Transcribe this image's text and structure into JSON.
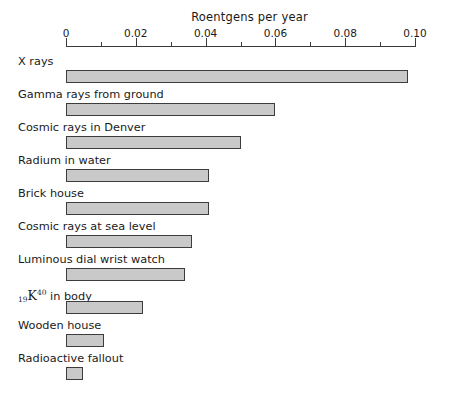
{
  "chart_data": {
    "type": "bar",
    "orientation": "horizontal",
    "title": "Roentgens per year",
    "xlabel": "Roentgens per year",
    "ylabel": "",
    "xlim": [
      0,
      0.1
    ],
    "xticks": [
      "0",
      "0.02",
      "0.04",
      "0.06",
      "0.08",
      "0.10"
    ],
    "xtick_values": [
      0,
      0.02,
      0.04,
      0.06,
      0.08,
      0.1
    ],
    "minor_tick_interval": 0.01,
    "grid": false,
    "legend": false,
    "categories": [
      "X rays",
      "Gamma rays from ground",
      "Cosmic rays in Denver",
      "Radium in water",
      "Brick house",
      "Cosmic rays at sea level",
      "Luminous dial wrist watch",
      "19K40 in body",
      "Wooden house",
      "Radioactive fallout"
    ],
    "values": [
      0.098,
      0.06,
      0.05,
      0.041,
      0.041,
      0.036,
      0.034,
      0.022,
      0.011,
      0.005
    ],
    "bar_fill_color": "#c9c9c9",
    "bar_edge_color": "#3c3c3c",
    "background_color": "#ffffff"
  },
  "rows": [
    {
      "label": "X rays",
      "value": 0.098,
      "html_label": false
    },
    {
      "label": "Gamma rays from ground",
      "value": 0.06,
      "html_label": false
    },
    {
      "label": "Cosmic rays in Denver",
      "value": 0.05,
      "html_label": false
    },
    {
      "label": "Radium in water",
      "value": 0.041,
      "html_label": false
    },
    {
      "label": "Brick house",
      "value": 0.041,
      "html_label": false
    },
    {
      "label": "Cosmic rays at sea level",
      "value": 0.036,
      "html_label": false
    },
    {
      "label": "Luminous dial wrist watch",
      "value": 0.034,
      "html_label": false
    },
    {
      "label": "K in body",
      "value": 0.022,
      "html_label": true,
      "element_subscript": "19",
      "element_symbol": "K",
      "element_superscript": "40",
      "suffix": " in body"
    },
    {
      "label": "Wooden house",
      "value": 0.011,
      "html_label": false
    },
    {
      "label": "Radioactive fallout",
      "value": 0.005,
      "html_label": false
    }
  ]
}
